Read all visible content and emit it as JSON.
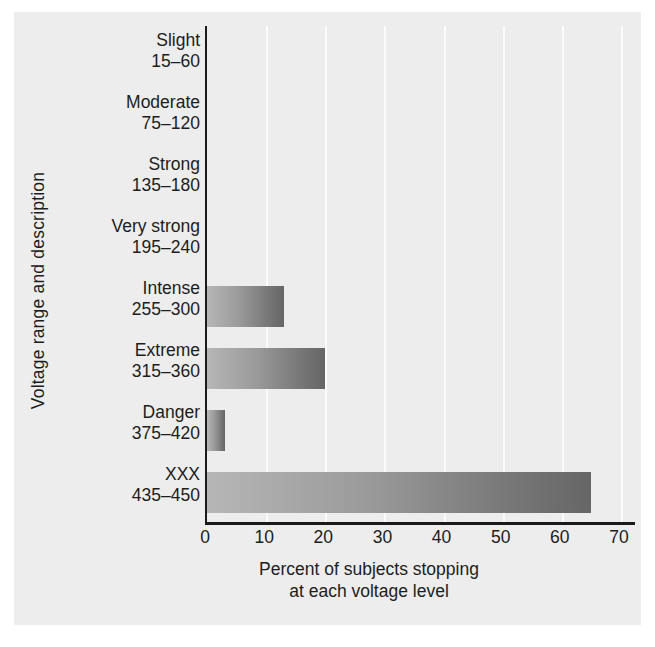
{
  "chart_data": {
    "type": "bar",
    "orientation": "horizontal",
    "title": "",
    "xlabel": "Percent of subjects stopping at each voltage level",
    "xlabel_line1": "Percent of subjects stopping",
    "xlabel_line2": "at each voltage level",
    "ylabel": "Voltage range and description",
    "xlim": [
      0,
      70
    ],
    "xticks": [
      0,
      10,
      20,
      30,
      40,
      50,
      60,
      70
    ],
    "xtick_labels": [
      "0",
      "10",
      "20",
      "30",
      "40",
      "50",
      "60",
      "70"
    ],
    "grid": "vertical-white",
    "legend": "none",
    "categories": [
      "Slight 15–60",
      "Moderate 75–120",
      "Strong 135–180",
      "Very strong 195–240",
      "Intense 255–300",
      "Extreme 315–360",
      "Danger 375–420",
      "XXX 435–450"
    ],
    "category_names": [
      "Slight",
      "Moderate",
      "Strong",
      "Very strong",
      "Intense",
      "Extreme",
      "Danger",
      "XXX"
    ],
    "category_ranges": [
      "15–60",
      "75–120",
      "135–180",
      "195–240",
      "255–300",
      "315–360",
      "375–420",
      "435–450"
    ],
    "values": [
      0,
      0,
      0,
      0,
      13,
      20,
      3,
      65
    ],
    "bar_gradient_start": "#b6b6b6",
    "bar_gradient_end": "#666666",
    "axis_color": "#1a1a1a",
    "plot_background": "#ecedec",
    "gridline_color": "#fbfbfb"
  },
  "axis": {
    "y_title": "Voltage range and description",
    "x_title_line1": "Percent of subjects stopping",
    "x_title_line2": "at each voltage level"
  },
  "rows": [
    {
      "name": "Slight",
      "range": "15–60",
      "value": 0
    },
    {
      "name": "Moderate",
      "range": "75–120",
      "value": 0
    },
    {
      "name": "Strong",
      "range": "135–180",
      "value": 0
    },
    {
      "name": "Very strong",
      "range": "195–240",
      "value": 0
    },
    {
      "name": "Intense",
      "range": "255–300",
      "value": 13
    },
    {
      "name": "Extreme",
      "range": "315–360",
      "value": 20
    },
    {
      "name": "Danger",
      "range": "375–420",
      "value": 3
    },
    {
      "name": "XXX",
      "range": "435–450",
      "value": 65
    }
  ]
}
